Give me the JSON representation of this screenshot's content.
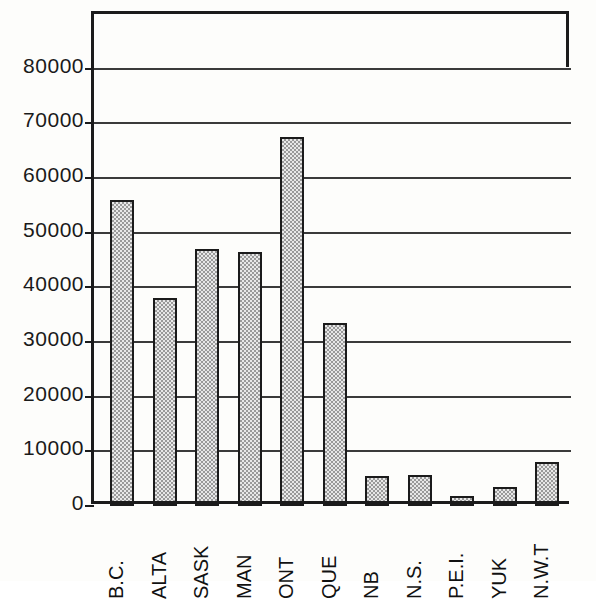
{
  "chart_data": {
    "type": "bar",
    "title": "",
    "xlabel": "",
    "ylabel": "",
    "categories": [
      "B.C.",
      "ALTA",
      "SASK",
      "MAN",
      "ONT",
      "QUE",
      "NB",
      "N.S.",
      "P.E.I.",
      "YUK",
      "N.W.T"
    ],
    "values": [
      56000,
      38000,
      47000,
      46500,
      67500,
      33500,
      5500,
      5600,
      1800,
      3500,
      8000
    ],
    "ylim": [
      0,
      90000
    ],
    "ytick_values": [
      0,
      10000,
      20000,
      30000,
      40000,
      50000,
      60000,
      70000,
      80000
    ],
    "ytick_labels": [
      "0",
      "10000",
      "20000",
      "30000",
      "40000",
      "50000",
      "60000",
      "70000",
      "80000"
    ],
    "grid": true,
    "legend": "none",
    "bar_fill": "#d0d0d0",
    "bar_edge": "#1b1b1b",
    "axis_color": "#1b1b1b"
  }
}
